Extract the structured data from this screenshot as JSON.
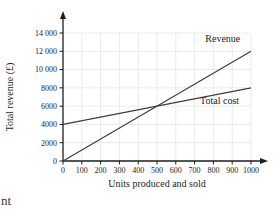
{
  "page": {
    "cropped_text_fragment": "nt"
  },
  "chart_data": {
    "type": "line",
    "title": "",
    "xlabel": "Units produced and sold",
    "ylabel": "Total revenue (£)",
    "xlim": [
      0,
      1000
    ],
    "ylim": [
      0,
      14000
    ],
    "x_ticks": [
      0,
      100,
      200,
      300,
      400,
      500,
      600,
      700,
      800,
      900,
      1000
    ],
    "y_ticks": [
      0,
      2000,
      4000,
      6000,
      8000,
      10000,
      12000,
      14000
    ],
    "y_tick_labels": [
      "0",
      "2000",
      "4000",
      "6000",
      "8000",
      "10 000",
      "12 000",
      "14 000"
    ],
    "grid": true,
    "axis_arrows": true,
    "legend_position": "inline-labels",
    "series": [
      {
        "name": "Revenue",
        "x": [
          0,
          1000
        ],
        "y": [
          0,
          12000
        ],
        "label": {
          "x": 850,
          "y": 13050
        }
      },
      {
        "name": "Total cost",
        "x": [
          0,
          1000
        ],
        "y": [
          4000,
          8000
        ],
        "label": {
          "x": 833,
          "y": 6250
        }
      }
    ],
    "intersection": {
      "x": 500,
      "y": 6000
    },
    "colors": {
      "line": "#3e3e3e",
      "axis": "#1d1d1d",
      "grid": "#e8ebeb",
      "text": "#1d1d1d"
    }
  }
}
